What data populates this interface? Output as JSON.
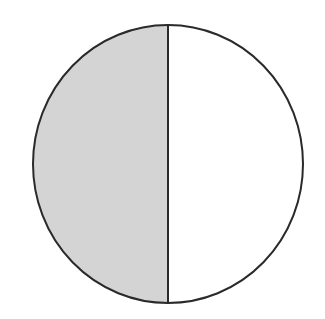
{
  "diagram": {
    "shape": "circle",
    "divisions": 2,
    "shaded_parts": 1,
    "fraction_shaded": "1/2",
    "colors": {
      "shaded": "#d4d4d4",
      "unshaded": "#ffffff",
      "stroke": "#2a2a2a"
    }
  }
}
